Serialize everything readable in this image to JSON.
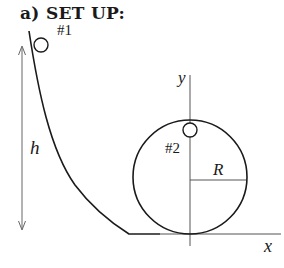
{
  "title": "a) SET UP:",
  "labels": {
    "ball1": "#1",
    "ball2": "#2",
    "height": "h",
    "radius": "R",
    "x_axis": "x",
    "y_axis": "y"
  },
  "colors": {
    "stroke": "#1a1a1a",
    "axis": "#555555",
    "background": "#ffffff"
  }
}
